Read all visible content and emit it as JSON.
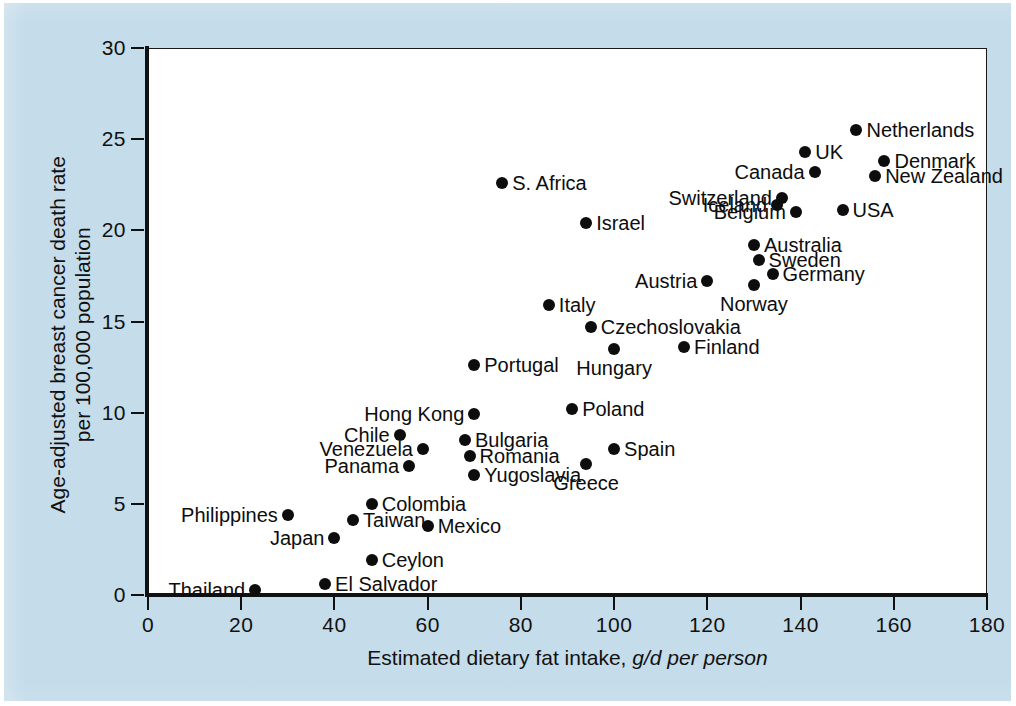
{
  "figure": {
    "background_color": "#c5dcea",
    "plot_background_color": "#ffffff",
    "marker_color": "#0d0d0d"
  },
  "chart_data": {
    "type": "scatter",
    "title": "",
    "xlabel": "Estimated dietary fat intake, ",
    "xlabel_italic": "g/d per person",
    "ylabel_line1": "Age-adjusted breast cancer death rate",
    "ylabel_line2": "per 100,000 population",
    "xlim": [
      0,
      180
    ],
    "ylim": [
      0,
      30
    ],
    "xticks": [
      0,
      20,
      40,
      60,
      80,
      100,
      120,
      140,
      160,
      180
    ],
    "yticks": [
      0,
      5,
      10,
      15,
      20,
      25,
      30
    ],
    "xtick_labels": [
      "0",
      "20",
      "40",
      "60",
      "80",
      "100",
      "120",
      "140",
      "160",
      "180"
    ],
    "ytick_labels": [
      "0",
      "5",
      "10",
      "15",
      "20",
      "25",
      "30"
    ],
    "grid": false,
    "legend": false,
    "points": [
      {
        "label": "Netherlands",
        "x": 152,
        "y": 25.5,
        "side": "right"
      },
      {
        "label": "UK",
        "x": 141,
        "y": 24.3,
        "side": "right"
      },
      {
        "label": "Denmark",
        "x": 158,
        "y": 23.8,
        "side": "right"
      },
      {
        "label": "Canada",
        "x": 143,
        "y": 23.2,
        "side": "left"
      },
      {
        "label": "New Zealand",
        "x": 156,
        "y": 23.0,
        "side": "right"
      },
      {
        "label": "S. Africa",
        "x": 76,
        "y": 22.6,
        "side": "right"
      },
      {
        "label": "Switzerland",
        "x": 136,
        "y": 21.8,
        "side": "left"
      },
      {
        "label": "Iceland",
        "x": 135,
        "y": 21.4,
        "side": "left"
      },
      {
        "label": "USA",
        "x": 149,
        "y": 21.1,
        "side": "right"
      },
      {
        "label": "Belgium",
        "x": 139,
        "y": 21.0,
        "side": "left"
      },
      {
        "label": "Israel",
        "x": 94,
        "y": 20.4,
        "side": "right"
      },
      {
        "label": "Australia",
        "x": 130,
        "y": 19.2,
        "side": "right"
      },
      {
        "label": "Sweden",
        "x": 131,
        "y": 18.4,
        "side": "right"
      },
      {
        "label": "Germany",
        "x": 134,
        "y": 17.6,
        "side": "right"
      },
      {
        "label": "Austria",
        "x": 120,
        "y": 17.2,
        "side": "left"
      },
      {
        "label": "Norway",
        "x": 130,
        "y": 17.0,
        "side": "below"
      },
      {
        "label": "Italy",
        "x": 86,
        "y": 15.9,
        "side": "right"
      },
      {
        "label": "Czechoslovakia",
        "x": 95,
        "y": 14.7,
        "side": "right"
      },
      {
        "label": "Finland",
        "x": 115,
        "y": 13.6,
        "side": "right"
      },
      {
        "label": "Hungary",
        "x": 100,
        "y": 13.5,
        "side": "below"
      },
      {
        "label": "Portugal",
        "x": 70,
        "y": 12.6,
        "side": "right"
      },
      {
        "label": "Poland",
        "x": 91,
        "y": 10.2,
        "side": "right"
      },
      {
        "label": "Hong Kong",
        "x": 70,
        "y": 9.9,
        "side": "left"
      },
      {
        "label": "Chile",
        "x": 54,
        "y": 8.8,
        "side": "left"
      },
      {
        "label": "Bulgaria",
        "x": 68,
        "y": 8.5,
        "side": "right"
      },
      {
        "label": "Venezuela",
        "x": 59,
        "y": 8.0,
        "side": "left"
      },
      {
        "label": "Spain",
        "x": 100,
        "y": 8.0,
        "side": "right"
      },
      {
        "label": "Romania",
        "x": 69,
        "y": 7.6,
        "side": "right"
      },
      {
        "label": "Greece",
        "x": 94,
        "y": 7.2,
        "side": "below"
      },
      {
        "label": "Panama",
        "x": 56,
        "y": 7.1,
        "side": "left"
      },
      {
        "label": "Yugoslavia",
        "x": 70,
        "y": 6.6,
        "side": "right"
      },
      {
        "label": "Colombia",
        "x": 48,
        "y": 5.0,
        "side": "right"
      },
      {
        "label": "Philippines",
        "x": 30,
        "y": 4.4,
        "side": "left"
      },
      {
        "label": "Taiwan",
        "x": 44,
        "y": 4.1,
        "side": "right"
      },
      {
        "label": "Mexico",
        "x": 60,
        "y": 3.8,
        "side": "right"
      },
      {
        "label": "Japan",
        "x": 40,
        "y": 3.1,
        "side": "left"
      },
      {
        "label": "Ceylon",
        "x": 48,
        "y": 1.9,
        "side": "right"
      },
      {
        "label": "El Salvador",
        "x": 38,
        "y": 0.6,
        "side": "right"
      },
      {
        "label": "Thailand",
        "x": 23,
        "y": 0.3,
        "side": "left"
      }
    ]
  }
}
